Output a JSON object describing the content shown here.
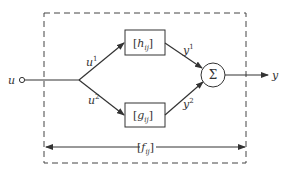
{
  "diagram": {
    "input": {
      "label": "u"
    },
    "branches": [
      {
        "input_label": "u",
        "input_sup": "1",
        "block_base": "h",
        "block_sub": "ij",
        "output_label": "y",
        "output_sup": "1"
      },
      {
        "input_label": "u",
        "input_sup": "2",
        "block_base": "g",
        "block_sub": "ij",
        "output_label": "y",
        "output_sup": "2"
      }
    ],
    "summer": {
      "symbol": "Σ"
    },
    "output": {
      "label": "y"
    },
    "overall": {
      "base": "f",
      "sub": "ij"
    },
    "colors": {
      "stroke": "#333333",
      "background": "#ffffff"
    }
  }
}
